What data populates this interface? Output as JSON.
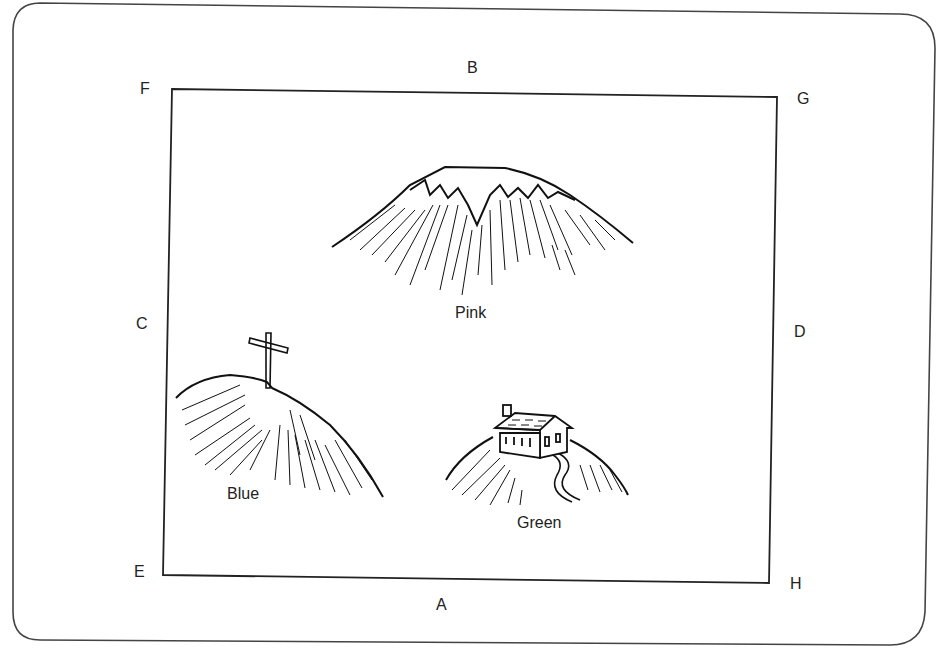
{
  "diagram": {
    "type": "map-card",
    "frame_labels": {
      "A": "A",
      "B": "B",
      "C": "C",
      "D": "D",
      "E": "E",
      "F": "F",
      "G": "G",
      "H": "H"
    },
    "hills": [
      {
        "id": "pink",
        "label": "Pink",
        "feature": "snow-capped peak"
      },
      {
        "id": "blue",
        "label": "Blue",
        "feature": "cross on summit"
      },
      {
        "id": "green",
        "label": "Green",
        "feature": "house with winding path"
      }
    ]
  }
}
